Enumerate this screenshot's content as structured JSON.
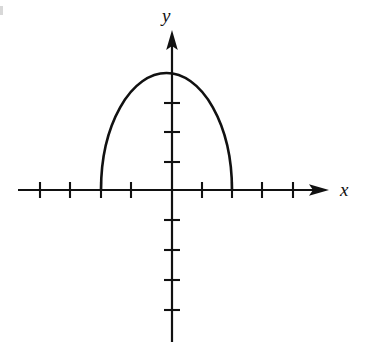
{
  "figure": {
    "background_color": "#ffffff",
    "ink_color": "#111111",
    "width": 365,
    "height": 357
  },
  "axes": {
    "x_label": "x",
    "y_label": "y",
    "origin_px": [
      172,
      190
    ],
    "unit_px": 30,
    "x_axis": {
      "start_px": 18,
      "end_px": 325,
      "arrow": "right-arrow",
      "tick_positions_px": [
        40,
        70,
        101,
        131,
        202,
        232,
        262,
        293
      ],
      "tick_half_length_px": 8,
      "tick_values": [
        -4.4,
        -3.4,
        -2.4,
        -1.4,
        1,
        2,
        3,
        4
      ]
    },
    "y_axis": {
      "start_px": 342,
      "end_px": 32,
      "arrow": "up-arrow",
      "tick_positions_px": [
        103,
        132,
        162,
        220,
        250,
        280,
        310
      ],
      "tick_half_length_px": 8,
      "tick_values": [
        3,
        2,
        1,
        -1,
        -2,
        -3,
        -4
      ]
    },
    "grid": false,
    "tick_labels_shown": false
  },
  "chart_data": {
    "type": "line",
    "title": "",
    "subtitle": "",
    "xlabel": "x",
    "ylabel": "y",
    "xlim": [
      -5.1,
      5.1
    ],
    "ylim": [
      -5.1,
      4.3
    ],
    "grid": false,
    "legend": null,
    "annotations": [],
    "curves": [
      {
        "name": "upper-semi-ellipse",
        "shape": "elliptical-arc-upper-half",
        "stroke": "#111111",
        "stroke_width": 2.6,
        "center_xy": [
          1.0,
          0.0
        ],
        "semi_axis_x": 2.18,
        "semi_axis_y": 3.9,
        "x_intercepts": [
          -1.18,
          2.0
        ],
        "vertex_xy": [
          1.0,
          3.9
        ],
        "endpoints_px": [
          [
            101,
            190
          ],
          [
            232,
            190
          ]
        ],
        "vertex_px": [
          172,
          73
        ],
        "x": [
          -1.18,
          -1.1,
          -0.95,
          -0.75,
          -0.5,
          -0.2,
          0.15,
          0.5,
          0.85,
          1.0,
          1.15,
          1.5,
          1.85,
          2.0
        ],
        "y": [
          0.0,
          1.08,
          1.77,
          2.36,
          2.85,
          3.3,
          3.65,
          3.84,
          3.9,
          3.9,
          3.9,
          3.74,
          3.18,
          0.0
        ]
      }
    ]
  },
  "artifacts": {
    "top_left_scan_mark": "scan-edge-mark"
  }
}
